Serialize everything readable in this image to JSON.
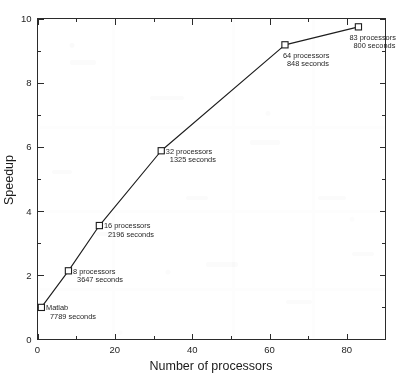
{
  "chart_data": {
    "type": "line",
    "title": "",
    "xlabel": "Number of processors",
    "ylabel": "Speedup",
    "xlim": [
      0,
      90
    ],
    "ylim": [
      0,
      10
    ],
    "xticks": [
      0,
      20,
      40,
      60,
      80
    ],
    "yticks": [
      0,
      2,
      4,
      6,
      8,
      10
    ],
    "xtick_labels": [
      "0",
      "20",
      "40",
      "60",
      "80"
    ],
    "ytick_labels": [
      "0",
      "2",
      "4",
      "6",
      "8",
      "10"
    ],
    "x_minor_step": 10,
    "y_minor_step": 1,
    "grid": false,
    "legend": false,
    "marker": "open-square",
    "series": [
      {
        "name": "Speedup",
        "points": [
          {
            "x": 1,
            "y": 1.0,
            "processors_label": "Matlab",
            "seconds_label": "7789 seconds",
            "seconds": 7789,
            "label_anchor": "right"
          },
          {
            "x": 8,
            "y": 2.14,
            "processors_label": "8 processors",
            "seconds_label": "3647 seconds",
            "seconds": 3647,
            "label_anchor": "right"
          },
          {
            "x": 16,
            "y": 3.55,
            "processors_label": "16 processors",
            "seconds_label": "2196 seconds",
            "seconds": 2196,
            "label_anchor": "right"
          },
          {
            "x": 32,
            "y": 5.88,
            "processors_label": "32 processors",
            "seconds_label": "1325 seconds",
            "seconds": 1325,
            "label_anchor": "right"
          },
          {
            "x": 64,
            "y": 9.18,
            "processors_label": "64 processors",
            "seconds_label": "848 seconds",
            "seconds": 848,
            "label_anchor": "below-right"
          },
          {
            "x": 83,
            "y": 9.74,
            "processors_label": "83 processors",
            "seconds_label": "800 seconds",
            "seconds": 800,
            "label_anchor": "below-left"
          }
        ]
      }
    ]
  },
  "colors": {
    "line": "#1d1d1d",
    "marker_fill": "#ffffff",
    "marker_stroke": "#1d1d1d",
    "axis": "#2b2b2b",
    "text": "#1f1f1f",
    "background": "#ffffff"
  }
}
